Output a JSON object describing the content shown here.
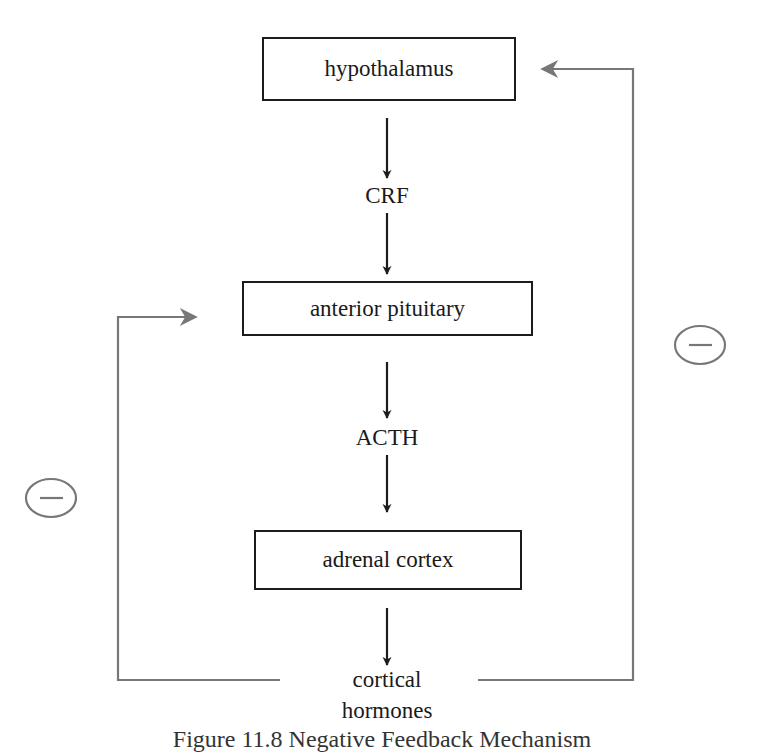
{
  "diagram": {
    "nodes": {
      "hypothalamus": "hypothalamus",
      "crf": "CRF",
      "anterior_pituitary": "anterior pituitary",
      "acth": "ACTH",
      "adrenal_cortex": "adrenal cortex",
      "cortical_hormones_line1": "cortical",
      "cortical_hormones_line2": "hormones"
    },
    "feedback": {
      "right_symbol": "−",
      "left_symbol": "−",
      "right_meaning": "negative feedback: cortical hormones inhibit hypothalamus",
      "left_meaning": "negative feedback: cortical hormones inhibit anterior pituitary"
    },
    "colors": {
      "main_flow": "#1c1c1c",
      "feedback_lines": "#777777"
    },
    "caption": "Figure 11.8  Negative Feedback Mechanism"
  }
}
